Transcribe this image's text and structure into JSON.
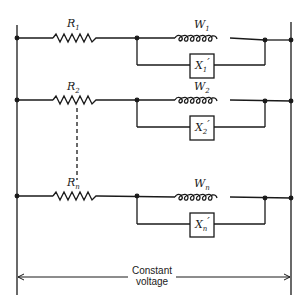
{
  "diagram": {
    "type": "circuit",
    "branches": [
      {
        "resistor": {
          "name": "R",
          "sub": "1"
        },
        "coil": {
          "name": "W",
          "sub": "1"
        },
        "box": {
          "name": "X",
          "sub": "1",
          "prime": "′"
        }
      },
      {
        "resistor": {
          "name": "R",
          "sub": "2"
        },
        "coil": {
          "name": "W",
          "sub": "2"
        },
        "box": {
          "name": "X",
          "sub": "2",
          "prime": "′"
        }
      },
      {
        "resistor": {
          "name": "R",
          "sub": "n"
        },
        "coil": {
          "name": "W",
          "sub": "n"
        },
        "box": {
          "name": "X",
          "sub": "n",
          "prime": "′"
        }
      }
    ],
    "caption": {
      "line1": "Constant",
      "line2": "voltage"
    }
  }
}
